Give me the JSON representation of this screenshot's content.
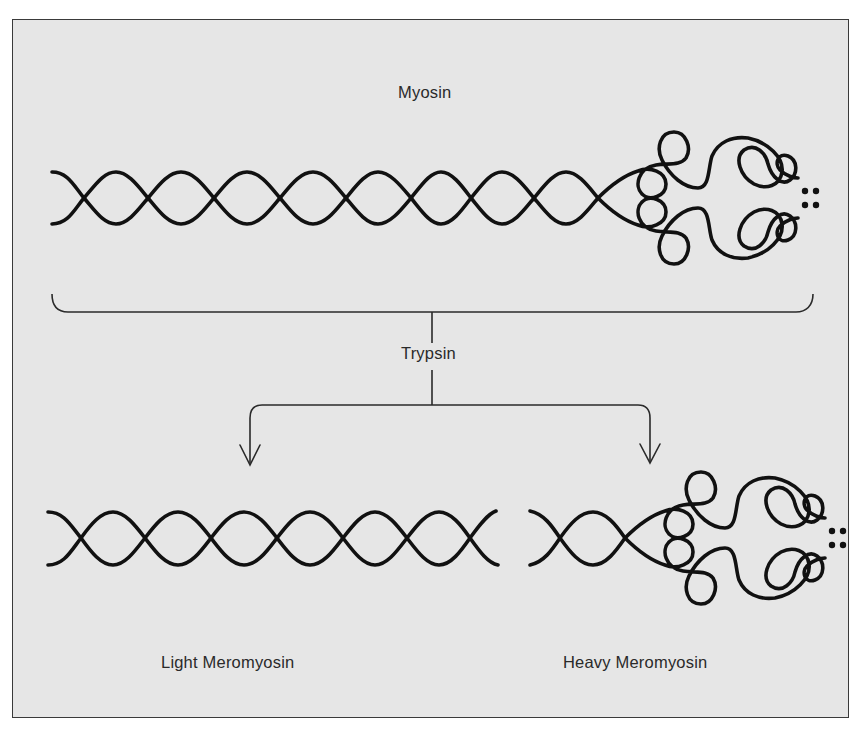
{
  "diagram": {
    "title": "Myosin",
    "enzyme_label": "Trypsin",
    "products": [
      {
        "label": "Light Meromyosin"
      },
      {
        "label": "Heavy Meromyosin"
      }
    ]
  },
  "colors": {
    "background": "#e6e6e6",
    "stroke": "#111111",
    "frame": "#3a3a3a",
    "text": "#2a2a2a"
  }
}
